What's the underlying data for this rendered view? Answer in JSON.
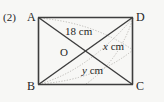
{
  "figure": {
    "problem_number": "(2)",
    "shape": "rectangle",
    "vertices": [
      {
        "id": "A",
        "label": "A",
        "position": "top-left"
      },
      {
        "id": "D",
        "label": "D",
        "position": "top-right"
      },
      {
        "id": "B",
        "label": "B",
        "position": "bottom-left"
      },
      {
        "id": "C",
        "label": "C",
        "position": "bottom-right"
      }
    ],
    "center_point": {
      "id": "O",
      "label": "O"
    },
    "measurements": [
      {
        "id": "diagonal-ac",
        "value": "18",
        "unit": "cm",
        "text": "18 cm"
      },
      {
        "id": "segment-od",
        "value": "x",
        "unit": "cm",
        "variable": "x",
        "unit_text": "cm"
      },
      {
        "id": "segment-ob",
        "value": "y",
        "unit": "cm",
        "variable": "y",
        "unit_text": "cm"
      }
    ],
    "colors": {
      "background": "#f7f7f5",
      "stroke": "#3a3a3a",
      "dotted_stroke": "#b9b7b2",
      "text": "#262626"
    },
    "geometry": {
      "rect": {
        "x": 38,
        "y": 17,
        "width": 95,
        "height": 68
      },
      "intersection": {
        "x": 85.5,
        "y": 51
      }
    }
  }
}
